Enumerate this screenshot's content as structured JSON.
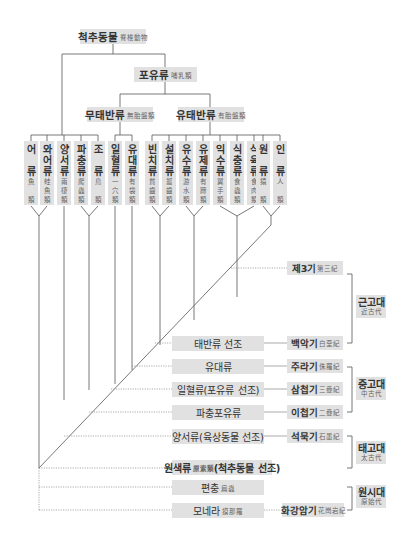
{
  "tree": {
    "root": {
      "ko": "척추동물",
      "han": "脊椎動物"
    },
    "mammals": {
      "ko": "포유류",
      "han": "哺乳類"
    },
    "marsupials_branch": {
      "ko": "무태반류",
      "han": "無胎盤類"
    },
    "placentals_branch": {
      "ko": "유태반류",
      "han": "有胎盤類"
    }
  },
  "classes": [
    {
      "ko": [
        "어",
        "",
        "류"
      ],
      "han": [
        "魚",
        "",
        "類"
      ]
    },
    {
      "ko": [
        "와",
        "어",
        "류"
      ],
      "han": [
        "蛙",
        "魚",
        "類"
      ]
    },
    {
      "ko": [
        "양",
        "서",
        "류"
      ],
      "han": [
        "兩",
        "棲",
        "類"
      ]
    },
    {
      "ko": [
        "파",
        "충",
        "류"
      ],
      "han": [
        "爬",
        "蟲",
        "類"
      ]
    },
    {
      "ko": [
        "조",
        "",
        "류"
      ],
      "han": [
        "鳥",
        "",
        "類"
      ]
    },
    {
      "ko": [
        "일",
        "혈",
        "류"
      ],
      "han": [
        "一",
        "穴",
        "類"
      ]
    },
    {
      "ko": [
        "유",
        "대",
        "류"
      ],
      "han": [
        "有",
        "袋",
        "類"
      ]
    },
    {
      "ko": [
        "빈",
        "치",
        "류"
      ],
      "han": [
        "貧",
        "齒",
        "類"
      ]
    },
    {
      "ko": [
        "설",
        "치",
        "류"
      ],
      "han": [
        "齧",
        "齒",
        "類"
      ]
    },
    {
      "ko": [
        "유",
        "수",
        "류"
      ],
      "han": [
        "游",
        "水",
        "類"
      ]
    },
    {
      "ko": [
        "유",
        "제",
        "류"
      ],
      "han": [
        "有",
        "蹄",
        "類"
      ]
    },
    {
      "ko": [
        "익",
        "수",
        "류"
      ],
      "han": [
        "翼",
        "手",
        "類"
      ]
    },
    {
      "ko": [
        "식",
        "충",
        "류"
      ],
      "han": [
        "食",
        "蟲",
        "類"
      ]
    },
    {
      "ko": [
        "식",
        "육",
        "류"
      ],
      "han": [
        "食",
        "肉",
        "類"
      ]
    },
    {
      "ko": [
        "원",
        "",
        "류"
      ],
      "han": [
        "猿",
        "",
        "類"
      ]
    },
    {
      "ko": [
        "인",
        "",
        "류"
      ],
      "han": [
        "人",
        "",
        "類"
      ]
    }
  ],
  "ancestors": [
    {
      "ko": "태반류 선조",
      "han": ""
    },
    {
      "ko": "유대류",
      "han": ""
    },
    {
      "ko": "일혈류(포유류 선조)",
      "han": ""
    },
    {
      "ko": "파충포유류",
      "han": ""
    },
    {
      "ko": "양서류(육상동물 선조)",
      "han": ""
    },
    {
      "ko": "원색류",
      "han": "原索類",
      "suffix": "(척추동물 선조)"
    },
    {
      "ko": "편충",
      "han": "扁蟲"
    },
    {
      "ko": "모네라",
      "han": "摸那羅"
    }
  ],
  "eras": [
    {
      "ko": "제3기",
      "han": "第三紀"
    },
    {
      "ko": "백악기",
      "han": "白堊紀"
    },
    {
      "ko": "주라기",
      "han": "侏羅紀"
    },
    {
      "ko": "삼첩기",
      "han": "三疊紀"
    },
    {
      "ko": "이첩기",
      "han": "二疊紀"
    },
    {
      "ko": "석묵기",
      "han": "石墨紀"
    },
    {
      "ko": "화강암기",
      "han": "花崗岩紀"
    }
  ],
  "periods": [
    {
      "ko": "근고대",
      "han": "近古代"
    },
    {
      "ko": "중고대",
      "han": "中古代"
    },
    {
      "ko": "태고대",
      "han": "太古代"
    },
    {
      "ko": "원시대",
      "han": "原始代"
    }
  ]
}
